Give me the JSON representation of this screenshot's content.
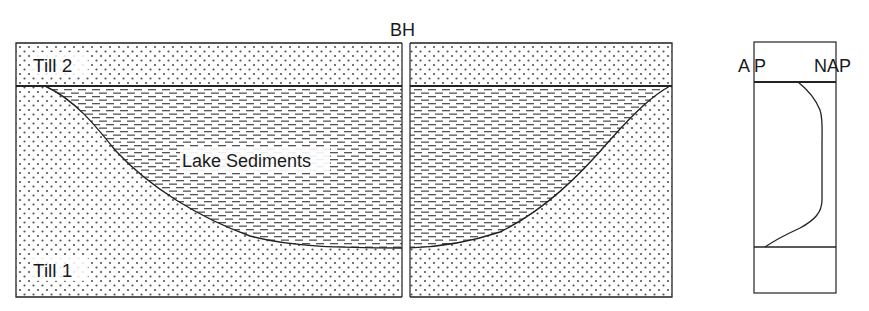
{
  "cross_section": {
    "borehole_label": "BH",
    "layers": {
      "upper": "Till 2",
      "basin_fill": "Lake Sediments",
      "lower": "Till 1"
    }
  },
  "pollen_diagram": {
    "left_label": "A P",
    "right_label": "NAP"
  },
  "colors": {
    "ink": "#1a1a1a",
    "dot": "#555555",
    "dash": "#555555",
    "background": "#ffffff"
  }
}
